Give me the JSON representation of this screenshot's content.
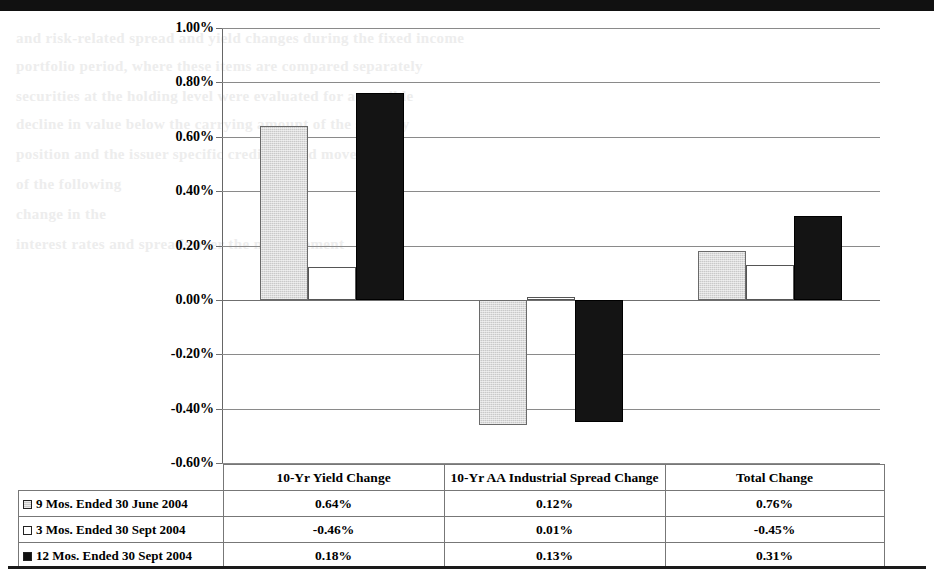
{
  "artifacts": {
    "bleed_lines": [
      {
        "text": "and risk-related spread and yield changes during the fixed income",
        "left": 16,
        "top": 30
      },
      {
        "text": "portfolio period, where these items are compared separately",
        "left": 16,
        "top": 58
      },
      {
        "text": "securities at the holding level were evaluated for a possible",
        "left": 16,
        "top": 88
      },
      {
        "text": "decline in value below the carrying amount of the security",
        "left": 16,
        "top": 116
      },
      {
        "text": "position and the issuer specific credit spread movement",
        "left": 16,
        "top": 146
      },
      {
        "text": "of the following",
        "left": 16,
        "top": 176
      },
      {
        "text": "change in the",
        "left": 16,
        "top": 206
      },
      {
        "text": "interest rates and spreads over the measurement",
        "left": 16,
        "top": 236
      }
    ]
  },
  "chart_data": {
    "type": "bar",
    "title": "",
    "subtitle": "",
    "xlabel": "",
    "ylabel": "",
    "ylim": [
      -0.6,
      1.0
    ],
    "ytick_labels": [
      "1.00%",
      "0.80%",
      "0.60%",
      "0.40%",
      "0.20%",
      "0.00%",
      "-0.20%",
      "-0.40%",
      "-0.60%"
    ],
    "ytick_values": [
      1.0,
      0.8,
      0.6,
      0.4,
      0.2,
      0.0,
      -0.2,
      -0.4,
      -0.6
    ],
    "grid": true,
    "legend_position": "bottom-table",
    "categories": [
      "10-Yr Yield Change",
      "10-Yr AA Industrial Spread Change",
      "Total Change"
    ],
    "series": [
      {
        "name": "9 Mos. Ended 30 June 2004",
        "marker": "gray-square",
        "color": "#c9c9c9",
        "values": [
          0.64,
          -0.46,
          0.18
        ],
        "labels": [
          "0.64%",
          "-0.46%",
          "0.18%"
        ]
      },
      {
        "name": "3 Mos. Ended 30 Sept 2004",
        "marker": "white-square",
        "color": "#ffffff",
        "values": [
          0.12,
          0.01,
          0.13
        ],
        "labels": [
          "0.12%",
          "0.01%",
          "0.13%"
        ]
      },
      {
        "name": "12 Mos. Ended 30 Sept 2004",
        "marker": "black-square",
        "color": "#141414",
        "values": [
          0.76,
          -0.45,
          0.31
        ],
        "labels": [
          "0.76%",
          "-0.45%",
          "0.31%"
        ]
      }
    ],
    "table": {
      "row_labels": [
        "9 Mos. Ended 30 June 2004",
        "3 Mos. Ended 30 Sept 2004",
        "12 Mos. Ended 30 Sept 2004"
      ],
      "column_headers": [
        "10-Yr Yield Change",
        "10-Yr AA Industrial Spread Change",
        "Total Change"
      ],
      "rows": [
        {
          "label": "9 Mos. Ended 30 June 2004",
          "marker": "gray-square",
          "cells": [
            "0.64%",
            "0.12%",
            "0.76%"
          ]
        },
        {
          "label": "3 Mos. Ended 30 Sept 2004",
          "marker": "white-square",
          "cells": [
            "-0.46%",
            "0.01%",
            "-0.45%"
          ]
        },
        {
          "label": "12 Mos. Ended 30 Sept 2004",
          "marker": "black-square",
          "cells": [
            "0.18%",
            "0.13%",
            "0.31%"
          ]
        }
      ]
    }
  }
}
